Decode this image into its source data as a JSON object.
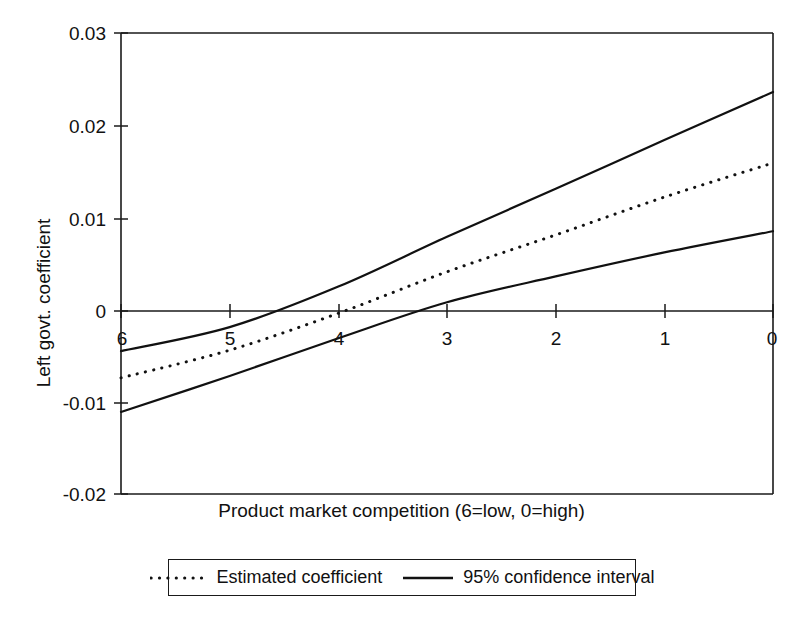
{
  "chart_data": {
    "type": "line",
    "title": "",
    "xlabel": "Product market competition (6=low, 0=high)",
    "ylabel": "Left govt. coefficient",
    "xlim": [
      6,
      0
    ],
    "ylim": [
      -0.02,
      0.03
    ],
    "x_reversed": true,
    "grid": false,
    "legend_position": "below-axis-centered",
    "x_ticks": [
      "6",
      "5",
      "4",
      "3",
      "2",
      "1",
      "0"
    ],
    "x_tick_values": [
      6,
      5,
      4,
      3,
      2,
      1,
      0
    ],
    "y_ticks": [
      "0.03",
      "0.02",
      "0.01",
      "0",
      "-0.01",
      "-0.02"
    ],
    "y_tick_values": [
      0.03,
      0.02,
      0.01,
      0,
      -0.01,
      -0.02
    ],
    "x": [
      6,
      5,
      4,
      3,
      2,
      1,
      0
    ],
    "series": [
      {
        "name": "Estimated coefficient",
        "style": "dotted",
        "values": [
          -0.0074,
          -0.0044,
          -0.0004,
          0.0041,
          0.0081,
          0.0122,
          0.0159
        ]
      },
      {
        "name": "95% confidence interval upper",
        "style": "solid",
        "values": [
          -0.0045,
          -0.0019,
          0.0025,
          0.0079,
          0.0131,
          0.0184,
          0.0236
        ]
      },
      {
        "name": "95% confidence interval lower",
        "style": "solid",
        "values": [
          -0.0111,
          -0.0072,
          -0.0031,
          0.0008,
          0.0036,
          0.0062,
          0.0085
        ]
      }
    ],
    "annotations": []
  },
  "axes": {
    "y_title": "Left govt. coefficient",
    "x_title": "Product market competition (6=low, 0=high)",
    "y_tick_labels": [
      "0.03",
      "0.02",
      "0.01",
      "0",
      "-0.01",
      "-0.02"
    ],
    "x_tick_labels": [
      "6",
      "5",
      "4",
      "3",
      "2",
      "1",
      "0"
    ]
  },
  "legend": {
    "entries": [
      {
        "label": "Estimated coefficient",
        "style": "dotted"
      },
      {
        "label": "95% confidence interval",
        "style": "solid"
      }
    ]
  },
  "caption": {
    "text": ""
  },
  "colors": {
    "ink": "#111111",
    "frame": "#1a1a1a",
    "background": "#ffffff"
  }
}
